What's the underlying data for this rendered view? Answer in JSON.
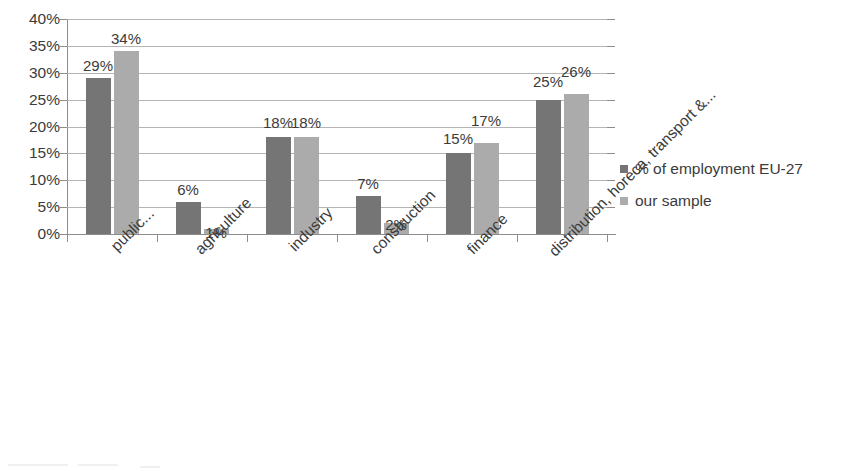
{
  "chart_data": {
    "type": "bar",
    "title": "",
    "xlabel": "",
    "ylabel": "",
    "ylim": [
      0,
      40
    ],
    "grid": true,
    "legend_position": "right",
    "categories": [
      "public...",
      "agriculture",
      "industry",
      "construction",
      "finance",
      "distribution, horeca, transport &..."
    ],
    "series": [
      {
        "name": "% of employment EU-27",
        "color": "#757575",
        "values": [
          29,
          6,
          18,
          7,
          15,
          25
        ],
        "labels": [
          "29%",
          "6%",
          "18%",
          "7%",
          "15%",
          "25%"
        ]
      },
      {
        "name": "our sample",
        "color": "#ababab",
        "values": [
          34,
          1,
          18,
          2,
          17,
          26
        ],
        "labels": [
          "34%",
          "1%",
          "18%",
          "2%",
          "17%",
          "26%"
        ]
      }
    ],
    "y_ticks": [
      0,
      5,
      10,
      15,
      20,
      25,
      30,
      35,
      40
    ],
    "y_tick_labels": [
      "0%",
      "5%",
      "10%",
      "15%",
      "20%",
      "25%",
      "30%",
      "35%",
      "40%"
    ]
  },
  "legend": {
    "items": [
      {
        "label": "% of employment EU-27",
        "swatch": "dark"
      },
      {
        "label": "our sample",
        "swatch": "light"
      }
    ]
  },
  "colors": {
    "series_1": "#757575",
    "series_2": "#ababab",
    "gridline": "#b4b4b4",
    "axis": "#8d8d8d",
    "text": "#3b3b3b",
    "background": "#ffffff"
  }
}
